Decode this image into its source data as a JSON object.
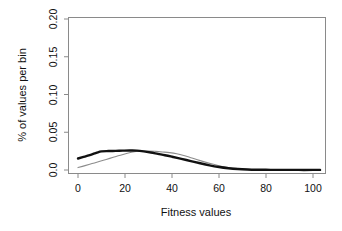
{
  "chart_data": {
    "type": "line",
    "title": "",
    "subtitle": "",
    "xlabel": "Fitness values",
    "ylabel": "% of values per bin",
    "xlim": [
      0,
      104
    ],
    "ylim": [
      0.0,
      0.2
    ],
    "grid": false,
    "legend": "none",
    "xticks": [
      0,
      20,
      40,
      60,
      80,
      100
    ],
    "xtick_labels": [
      "0",
      "20",
      "40",
      "60",
      "80",
      "100"
    ],
    "yticks": [
      0.0,
      0.05,
      0.1,
      0.15,
      0.2
    ],
    "ytick_labels": [
      "0.0",
      "0.05",
      "0.10",
      "0.15",
      "0.20"
    ],
    "series": [
      {
        "name": "black-curve",
        "color": "#111111",
        "linewidth": 2.4,
        "x": [
          0,
          2,
          5,
          8,
          10,
          13,
          16,
          19,
          22,
          25,
          28,
          31,
          34,
          37,
          40,
          44,
          48,
          52,
          56,
          60,
          64,
          68,
          72,
          76,
          82,
          88,
          94,
          100,
          103
        ],
        "values": [
          0.0152,
          0.017,
          0.0196,
          0.023,
          0.0247,
          0.0251,
          0.0253,
          0.0256,
          0.0258,
          0.0257,
          0.0247,
          0.0232,
          0.0214,
          0.0196,
          0.0176,
          0.0148,
          0.0118,
          0.0089,
          0.0062,
          0.004,
          0.0024,
          0.0013,
          0.0007,
          0.0004,
          0.0002,
          0.0002,
          0.0001,
          0.0001,
          0.0001
        ]
      },
      {
        "name": "gray-curve",
        "color": "#8c8c8c",
        "linewidth": 1.1,
        "x": [
          0,
          3,
          6,
          9,
          12,
          15,
          18,
          21,
          24,
          27,
          30,
          33,
          36,
          39,
          42,
          45,
          48,
          52,
          56,
          60,
          64,
          68,
          72,
          76,
          82,
          88,
          94,
          100,
          103
        ],
        "values": [
          0.0032,
          0.0058,
          0.0085,
          0.0112,
          0.014,
          0.0168,
          0.0196,
          0.0222,
          0.0242,
          0.0251,
          0.0252,
          0.0247,
          0.0239,
          0.023,
          0.0215,
          0.0192,
          0.0163,
          0.0124,
          0.0088,
          0.0056,
          0.0033,
          0.0018,
          0.001,
          0.0006,
          0.0003,
          0.0002,
          0.0001,
          0.0001,
          0.0001
        ]
      }
    ]
  },
  "colors": {
    "axis": "#8a8a8a",
    "black_series": "#111111",
    "gray_series": "#8c8c8c",
    "background": "#ffffff",
    "text": "#111111"
  }
}
